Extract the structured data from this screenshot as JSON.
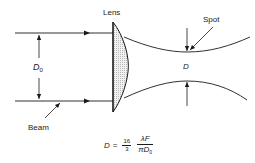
{
  "diagram": {
    "labels": {
      "lens": "Lens",
      "spot": "Spot",
      "beam": "Beam",
      "beam_diameter_symbol": "D",
      "beam_diameter_subscript": "0",
      "spot_diameter_symbol": "D"
    },
    "formula": {
      "lhs": "D",
      "equals": "=",
      "coef_numerator": "16",
      "coef_denominator": "3",
      "numerator": "λF",
      "denominator_symbol": "πD",
      "denominator_subscript": "0"
    },
    "colors": {
      "line": "#1a1a1a",
      "lens_fill": "#e6e6e6",
      "background": "#ffffff"
    }
  }
}
